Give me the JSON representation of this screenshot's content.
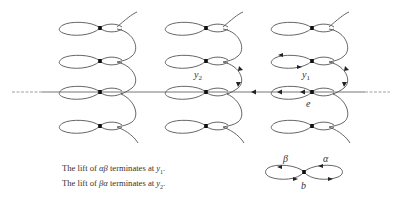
{
  "figure": {
    "columns": 3,
    "rows_per_column": 4,
    "horizontal_line_arrow_direction": "left",
    "labels": {
      "y1": {
        "base": "y",
        "sub": "1"
      },
      "y2": {
        "base": "y",
        "sub": "2"
      },
      "e": "e",
      "b": "b",
      "alpha": "α",
      "beta": "β"
    }
  },
  "caption": {
    "line1": {
      "prefix": "The lift of ",
      "word": "αβ",
      "middle": " terminates at ",
      "var": "y",
      "sub": "1",
      "suffix": "."
    },
    "line2": {
      "prefix": "The lift of ",
      "word": "βα",
      "middle": " terminates at ",
      "var": "y",
      "sub": "2",
      "suffix": "."
    }
  },
  "colors": {
    "stroke": "#555555",
    "vertex": "#111111",
    "text": "#333333"
  }
}
